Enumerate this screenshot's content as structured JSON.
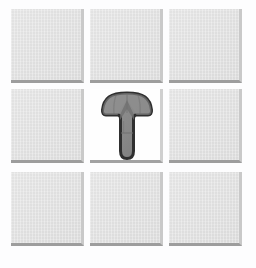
{
  "board": {
    "title": "Grid Puzzle Board",
    "rows": 3,
    "columns": 3,
    "tile_color": "#e2e2e2",
    "tile_shadow_color": "#9d9d9d",
    "background_color": "#fdfdfe",
    "cells": [
      {
        "id": "cell-r1c1",
        "row": 1,
        "column": 1,
        "state": "tile",
        "label": ""
      },
      {
        "id": "cell-r1c2",
        "row": 1,
        "column": 2,
        "state": "tile",
        "label": ""
      },
      {
        "id": "cell-r1c3",
        "row": 1,
        "column": 3,
        "state": "tile",
        "label": ""
      },
      {
        "id": "cell-r2c1",
        "row": 2,
        "column": 1,
        "state": "tile",
        "label": ""
      },
      {
        "id": "cell-r2c2",
        "row": 2,
        "column": 2,
        "state": "piece",
        "label": ""
      },
      {
        "id": "cell-r2c3",
        "row": 2,
        "column": 3,
        "state": "tile",
        "label": ""
      },
      {
        "id": "cell-r3c1",
        "row": 3,
        "column": 1,
        "state": "tile",
        "label": ""
      },
      {
        "id": "cell-r3c2",
        "row": 3,
        "column": 2,
        "state": "tile",
        "label": ""
      },
      {
        "id": "cell-r3c3",
        "row": 3,
        "column": 3,
        "state": "tile",
        "label": ""
      }
    ]
  },
  "piece": {
    "icon": "up-arrow-piece-icon",
    "name": "up-arrow-piece",
    "position_row": 2,
    "position_column": 2,
    "fill_color": "#8a8a8a",
    "fill_color_dark": "#7c7c7c",
    "outline_color": "#2f2f2f",
    "direction": "up"
  }
}
